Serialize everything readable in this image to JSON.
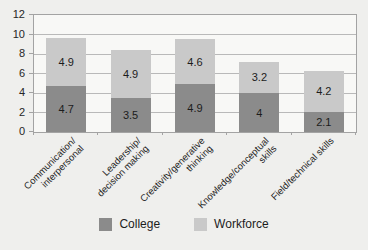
{
  "chart_data": {
    "type": "bar",
    "stacked": true,
    "title": "",
    "xlabel": "",
    "ylabel": "",
    "categories": [
      "Communication/\ninterpersonal",
      "Leadership/\ndecision making",
      "Creativity/generative\nthinking",
      "Knowledge/conceptual\nskills",
      "Field/technical skills"
    ],
    "series": [
      {
        "name": "College",
        "color": "#8b8b8b",
        "values": [
          4.7,
          3.5,
          4.9,
          4,
          2.1
        ]
      },
      {
        "name": "Workforce",
        "color": "#c9c9c9",
        "values": [
          4.9,
          4.9,
          4.6,
          3.2,
          4.2
        ]
      }
    ],
    "stack_totals": [
      9.6,
      8.4,
      9.5,
      7.2,
      6.3
    ],
    "ylim": [
      0,
      12
    ],
    "yticks": [
      0,
      2,
      4,
      6,
      8,
      10,
      12
    ],
    "grid": true,
    "legend_position": "bottom",
    "data_labels": true
  },
  "colors": {
    "background": "#efefed",
    "plot_background": "#f8f8f6",
    "gridline": "#b9b9b9",
    "plot_border": "#a3a3a3",
    "text": "#262626",
    "label_text": "#1c1c1c"
  }
}
